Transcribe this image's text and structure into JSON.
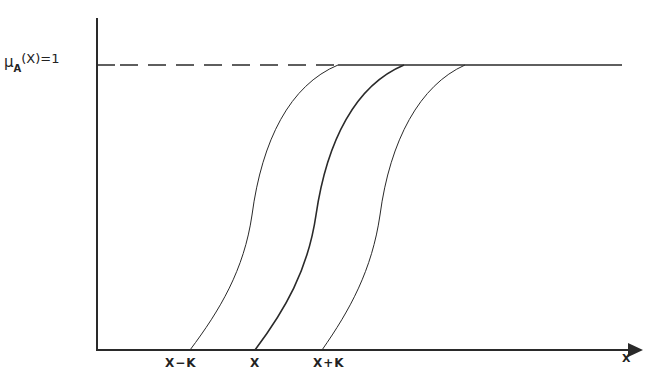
{
  "diagram": {
    "type": "membership-function-shift",
    "y_axis_label": {
      "symbol": "μ",
      "subscript": "A",
      "argument": "(X)=1"
    },
    "x_axis_label": "X",
    "x_ticks": [
      {
        "label": "X−K",
        "x": 190
      },
      {
        "label": "X",
        "x": 257
      },
      {
        "label": "X+K",
        "x": 325
      }
    ],
    "curves": [
      {
        "name": "curve-x-minus-k",
        "start_x": 190,
        "end_x": 338,
        "stroke_width": 1
      },
      {
        "name": "curve-x",
        "start_x": 255,
        "end_x": 404,
        "stroke_width": 1.6
      },
      {
        "name": "curve-x-plus-k",
        "start_x": 322,
        "end_x": 465,
        "stroke_width": 1
      }
    ],
    "reference_line": {
      "label": "μA(X)=1",
      "style": "dashed-then-solid",
      "y": 65
    },
    "colors": {
      "line": "#2a2a2a",
      "background": "#ffffff"
    }
  }
}
